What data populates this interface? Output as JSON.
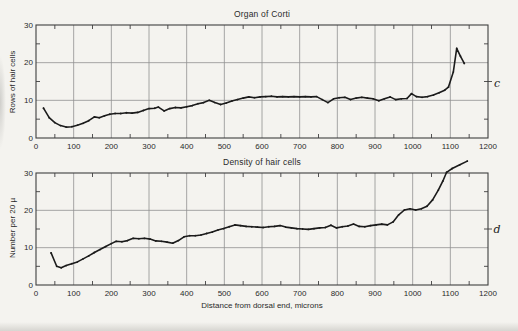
{
  "style": {
    "paper": "#f4f3ef",
    "ink": "#1b1b1b",
    "grid": "#909090",
    "frame": "#3f3f3f",
    "label": "#2a2a2a"
  },
  "chart_data": [
    {
      "type": "line",
      "panel": "c",
      "title": "Organ of Corti",
      "ylabel": "Rows of hair cells",
      "xlabel": "",
      "xlim": [
        0,
        1200
      ],
      "ylim": [
        0,
        30
      ],
      "x_tick_labels": [
        0,
        100,
        200,
        300,
        400,
        500,
        600,
        700,
        800,
        900,
        1000,
        1100,
        1200
      ],
      "y_tick_labels": [
        0,
        10,
        20,
        30
      ],
      "x_minor_step": 50,
      "y_minor_step": 5,
      "grid": true,
      "legend": "none",
      "points": [
        [
          20,
          7.9
        ],
        [
          35,
          5.4
        ],
        [
          50,
          4.1
        ],
        [
          65,
          3.3
        ],
        [
          80,
          2.9
        ],
        [
          95,
          3.0
        ],
        [
          110,
          3.4
        ],
        [
          125,
          3.9
        ],
        [
          140,
          4.6
        ],
        [
          155,
          5.6
        ],
        [
          168,
          5.4
        ],
        [
          182,
          5.9
        ],
        [
          196,
          6.3
        ],
        [
          210,
          6.5
        ],
        [
          225,
          6.5
        ],
        [
          240,
          6.7
        ],
        [
          255,
          6.6
        ],
        [
          270,
          6.8
        ],
        [
          285,
          7.3
        ],
        [
          300,
          7.8
        ],
        [
          315,
          7.9
        ],
        [
          325,
          8.2
        ],
        [
          340,
          7.2
        ],
        [
          355,
          7.8
        ],
        [
          370,
          8.1
        ],
        [
          385,
          8.0
        ],
        [
          400,
          8.3
        ],
        [
          415,
          8.6
        ],
        [
          430,
          9.1
        ],
        [
          445,
          9.4
        ],
        [
          460,
          10.0
        ],
        [
          475,
          9.4
        ],
        [
          490,
          8.9
        ],
        [
          505,
          9.3
        ],
        [
          520,
          9.8
        ],
        [
          535,
          10.2
        ],
        [
          550,
          10.6
        ],
        [
          565,
          10.9
        ],
        [
          580,
          10.7
        ],
        [
          595,
          10.9
        ],
        [
          610,
          11.0
        ],
        [
          625,
          11.1
        ],
        [
          640,
          10.9
        ],
        [
          655,
          11.0
        ],
        [
          670,
          10.9
        ],
        [
          685,
          11.0
        ],
        [
          700,
          10.9
        ],
        [
          715,
          11.0
        ],
        [
          730,
          10.9
        ],
        [
          745,
          11.0
        ],
        [
          760,
          10.2
        ],
        [
          775,
          9.4
        ],
        [
          790,
          10.4
        ],
        [
          805,
          10.7
        ],
        [
          820,
          10.8
        ],
        [
          835,
          10.2
        ],
        [
          850,
          10.6
        ],
        [
          865,
          10.8
        ],
        [
          880,
          10.6
        ],
        [
          895,
          10.4
        ],
        [
          910,
          9.9
        ],
        [
          925,
          10.4
        ],
        [
          940,
          10.9
        ],
        [
          955,
          10.2
        ],
        [
          970,
          10.4
        ],
        [
          985,
          10.5
        ],
        [
          997,
          11.8
        ],
        [
          1010,
          11.0
        ],
        [
          1025,
          10.8
        ],
        [
          1040,
          11.0
        ],
        [
          1055,
          11.4
        ],
        [
          1070,
          12.0
        ],
        [
          1085,
          12.7
        ],
        [
          1095,
          13.5
        ],
        [
          1108,
          17.5
        ],
        [
          1117,
          23.8
        ],
        [
          1127,
          21.7
        ],
        [
          1137,
          19.8
        ]
      ]
    },
    {
      "type": "line",
      "panel": "d",
      "title": "Density of hair cells",
      "ylabel": "Number per 20 µ",
      "xlabel": "Distance from dorsal end, microns",
      "xlim": [
        0,
        1200
      ],
      "ylim": [
        0,
        30
      ],
      "x_tick_labels": [
        0,
        100,
        200,
        300,
        400,
        500,
        600,
        700,
        800,
        900,
        1000,
        1100,
        1200
      ],
      "y_tick_labels": [
        0,
        10,
        20,
        30
      ],
      "x_minor_step": 50,
      "y_minor_step": 5,
      "grid": true,
      "legend": "none",
      "points": [
        [
          40,
          8.6
        ],
        [
          55,
          5.0
        ],
        [
          67,
          4.6
        ],
        [
          80,
          5.2
        ],
        [
          95,
          5.7
        ],
        [
          110,
          6.2
        ],
        [
          125,
          7.0
        ],
        [
          140,
          7.8
        ],
        [
          155,
          8.7
        ],
        [
          170,
          9.5
        ],
        [
          185,
          10.3
        ],
        [
          200,
          11.1
        ],
        [
          213,
          11.7
        ],
        [
          228,
          11.6
        ],
        [
          243,
          11.9
        ],
        [
          258,
          12.5
        ],
        [
          273,
          12.4
        ],
        [
          288,
          12.5
        ],
        [
          303,
          12.3
        ],
        [
          318,
          11.8
        ],
        [
          333,
          11.7
        ],
        [
          348,
          11.5
        ],
        [
          363,
          11.2
        ],
        [
          378,
          11.9
        ],
        [
          393,
          12.9
        ],
        [
          408,
          13.2
        ],
        [
          423,
          13.2
        ],
        [
          438,
          13.4
        ],
        [
          453,
          13.8
        ],
        [
          468,
          14.2
        ],
        [
          483,
          14.7
        ],
        [
          498,
          15.1
        ],
        [
          513,
          15.6
        ],
        [
          528,
          16.1
        ],
        [
          543,
          15.9
        ],
        [
          558,
          15.7
        ],
        [
          573,
          15.6
        ],
        [
          588,
          15.5
        ],
        [
          603,
          15.4
        ],
        [
          618,
          15.6
        ],
        [
          633,
          15.7
        ],
        [
          648,
          15.9
        ],
        [
          663,
          15.5
        ],
        [
          678,
          15.3
        ],
        [
          693,
          15.1
        ],
        [
          708,
          15.0
        ],
        [
          723,
          14.9
        ],
        [
          738,
          15.1
        ],
        [
          753,
          15.3
        ],
        [
          768,
          15.4
        ],
        [
          783,
          16.0
        ],
        [
          798,
          15.3
        ],
        [
          813,
          15.6
        ],
        [
          828,
          15.8
        ],
        [
          843,
          16.3
        ],
        [
          858,
          15.7
        ],
        [
          873,
          15.6
        ],
        [
          888,
          15.9
        ],
        [
          903,
          16.1
        ],
        [
          918,
          16.3
        ],
        [
          933,
          16.1
        ],
        [
          948,
          16.9
        ],
        [
          963,
          18.8
        ],
        [
          978,
          20.1
        ],
        [
          993,
          20.4
        ],
        [
          1008,
          20.1
        ],
        [
          1023,
          20.4
        ],
        [
          1038,
          21.1
        ],
        [
          1053,
          22.8
        ],
        [
          1068,
          25.4
        ],
        [
          1080,
          27.8
        ],
        [
          1090,
          30.2
        ],
        [
          1105,
          31.2
        ],
        [
          1125,
          32.2
        ],
        [
          1145,
          33.2
        ]
      ]
    }
  ]
}
